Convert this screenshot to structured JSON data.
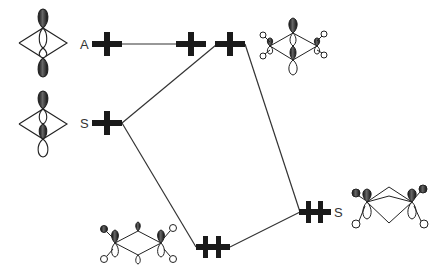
{
  "diagram": {
    "type": "molecular-orbital-correlation-diagram",
    "left_levels": [
      {
        "label": "A",
        "electrons": 1
      },
      {
        "label": "S",
        "electrons": 1
      }
    ],
    "middle_levels": [
      {
        "label": "",
        "electrons": 1,
        "position": "upper"
      },
      {
        "label": "",
        "electrons": 2,
        "position": "lower"
      }
    ],
    "upper_right_level": {
      "label": "",
      "electrons": 1
    },
    "right_level": {
      "label": "S",
      "electrons": 2
    },
    "colors": {
      "line": "#333333",
      "level": "#1a1a1a",
      "lobe_dark": "#2a2a2a",
      "lobe_light": "#ffffff"
    }
  }
}
